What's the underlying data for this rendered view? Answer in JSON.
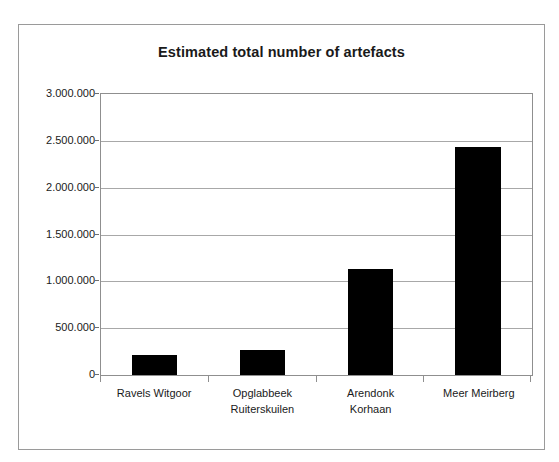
{
  "chart_data": {
    "type": "bar",
    "title": "Estimated total number of artefacts",
    "xlabel": "",
    "ylabel": "",
    "categories": [
      "Ravels Witgoor",
      "Opglabbeek Ruiterskuilen",
      "Arendonk Korhaan",
      "Meer Meirberg"
    ],
    "category_lines": [
      [
        "Ravels Witgoor",
        ""
      ],
      [
        "Opglabbeek",
        "Ruiterskuilen"
      ],
      [
        "Arendonk",
        "Korhaan"
      ],
      [
        "Meer Meirberg",
        ""
      ]
    ],
    "values": [
      210000,
      265000,
      1135000,
      2430000
    ],
    "ylim": [
      0,
      3000000
    ],
    "ytick_values": [
      0,
      500000,
      1000000,
      1500000,
      2000000,
      2500000,
      3000000
    ],
    "ytick_labels": [
      "0",
      "500.000",
      "1.000.000",
      "1.500.000",
      "2.000.000",
      "2.500.000",
      "3.000.000"
    ],
    "grid": true,
    "legend": false,
    "bar_color": "#000000",
    "plot_background": "#ffffff",
    "gridline_color": "#a8a8a8",
    "axis_color": "#8f8f8f",
    "frame_color": "#9a9a9a",
    "number_format": "dot-thousands-separator"
  }
}
